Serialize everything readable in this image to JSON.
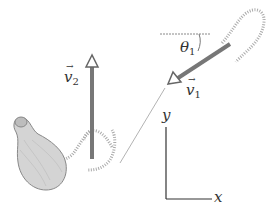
{
  "diagram": {
    "type": "physics-collision-vectors",
    "labels": {
      "v1": {
        "symbol": "v",
        "subscript": "1",
        "arrow": "→"
      },
      "v2": {
        "symbol": "v",
        "subscript": "2",
        "arrow": "→"
      },
      "theta1": {
        "symbol": "θ",
        "subscript": "1"
      },
      "axis_x": "x",
      "axis_y": "y"
    },
    "colors": {
      "vector_arrow": "#777777",
      "thin_line": "#999999",
      "dotted_curve": "#aaaaaa",
      "balloon_fill": "#cfcfcf",
      "balloon_stroke": "#888888",
      "axis": "#333333",
      "text": "#333333"
    }
  }
}
